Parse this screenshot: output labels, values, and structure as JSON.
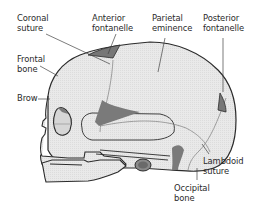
{
  "diagram": {
    "colors": {
      "bone": "#e6e6e6",
      "outline": "#2b2b2b",
      "suture": "#8a8a8a",
      "fontanelle": "#7a7a7a",
      "leader": "#444444",
      "text": "#2a2a2a"
    },
    "labels": {
      "coronal_suture": "Coronal\nsuture",
      "anterior_fontanelle": "Anterior\nfontanelle",
      "parietal_eminence": "Parietal\neminence",
      "posterior_fontanelle": "Posterior\nfontanelle",
      "frontal_bone": "Frontal\nbone",
      "brow": "Brow",
      "lambdoid_suture": "Lambdoid\nsuture",
      "occipital_bone": "Occipital\nbone"
    }
  }
}
